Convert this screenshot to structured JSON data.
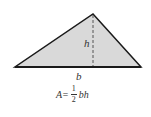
{
  "diagram": {
    "colors": {
      "fill": "#d9d9d9",
      "stroke": "#1a1a1a",
      "height_line": "#555555",
      "text": "#333333"
    },
    "vertices": {
      "left": [
        15,
        67
      ],
      "right": [
        141,
        67
      ],
      "apex": [
        93,
        14
      ]
    },
    "labels": {
      "height": "h",
      "base": "b"
    },
    "formula": {
      "lhs": "A=",
      "numerator": "1",
      "denominator": "2",
      "rhs": "bh"
    }
  }
}
